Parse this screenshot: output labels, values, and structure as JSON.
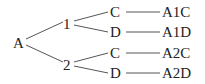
{
  "tree": {
    "root": "A",
    "level1": [
      "1",
      "2"
    ],
    "level2": [
      "C",
      "D",
      "C",
      "D"
    ],
    "outcomes": [
      "A1C",
      "A1D",
      "A2C",
      "A2D"
    ]
  }
}
